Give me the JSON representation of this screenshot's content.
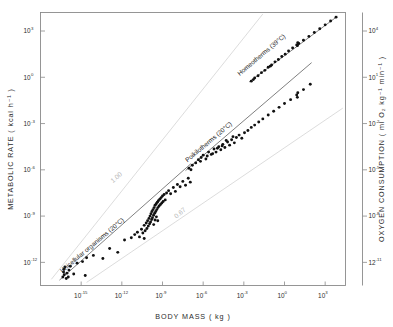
{
  "chart_data": {
    "type": "scatter",
    "title": "",
    "xlabel": "BODY  MASS ( kg )",
    "ylabel": "METABOLIC  RATE ( kcal h⁻¹ )",
    "y2label": "OXYGEN  CONSUMPTION ( ml O₂ kg⁻¹ min⁻¹ )",
    "xlim": [
      -18,
      4.5
    ],
    "ylim": [
      -13.5,
      4.2
    ],
    "y2lim": [
      -12.5,
      5.2
    ],
    "xscale": "log10",
    "yscale": "log10",
    "grid": false,
    "legend_position": "in-plot annotations",
    "xticks": [
      {
        "value": -15,
        "label": "10",
        "exp": "-15"
      },
      {
        "value": -12,
        "label": "10",
        "exp": "-12"
      },
      {
        "value": -9,
        "label": "10",
        "exp": "-9"
      },
      {
        "value": -6,
        "label": "10",
        "exp": "-6"
      },
      {
        "value": -3,
        "label": "10",
        "exp": "-3"
      },
      {
        "value": 0,
        "label": "10",
        "exp": "0"
      },
      {
        "value": 3,
        "label": "10",
        "exp": "3"
      }
    ],
    "yticks": [
      {
        "value": 3,
        "label": "10",
        "exp": "3"
      },
      {
        "value": 0,
        "label": "10",
        "exp": "0"
      },
      {
        "value": -3,
        "label": "10",
        "exp": "-3"
      },
      {
        "value": -6,
        "label": "10",
        "exp": "-6"
      },
      {
        "value": -9,
        "label": "10",
        "exp": "-9"
      },
      {
        "value": -12,
        "label": "10",
        "exp": "-12"
      }
    ],
    "y2ticks": [
      {
        "value": 4,
        "label": "10",
        "exp": "4"
      },
      {
        "value": 1,
        "label": "10",
        "exp": "1"
      },
      {
        "value": -2,
        "label": "10",
        "exp": "-2"
      },
      {
        "value": -5,
        "label": "10",
        "exp": "-5"
      },
      {
        "value": -8,
        "label": "10",
        "exp": "-8"
      },
      {
        "value": -11,
        "label": "12",
        "exp": "-11"
      }
    ],
    "reference_lines": [
      {
        "name": "slope-1.00",
        "label": "1.00",
        "slope": 1.0,
        "color": "#d8d8d8",
        "x0": -17.2,
        "y0": -13.1,
        "x1": -1.6,
        "y1": 4.1,
        "label_x": -12.3,
        "label_y": -6.6
      },
      {
        "name": "slope-0.67",
        "label": "0.67",
        "slope": 0.67,
        "color": "#d8d8d8",
        "x0": -14.6,
        "y0": -13.3,
        "x1": 4.3,
        "y1": -2.0,
        "label_x": -7.6,
        "label_y": -8.9
      }
    ],
    "series": [
      {
        "name": "Unicellular organisms (20°C)",
        "label": "Unicellular organisms (20°C)",
        "temperature": "20°C",
        "label_x": -14.1,
        "label_y": -11.0,
        "label_rotation": -40,
        "fit": {
          "x0": -16.6,
          "y0": -13.15,
          "x1": -6.9,
          "y1": -5.6
        },
        "points": [
          [
            -16.35,
            -12.95
          ],
          [
            -16.3,
            -12.62
          ],
          [
            -16.28,
            -12.45
          ],
          [
            -16.25,
            -12.8
          ],
          [
            -16.2,
            -12.3
          ],
          [
            -16.1,
            -13.05
          ],
          [
            -16.05,
            -12.7
          ],
          [
            -15.95,
            -12.95
          ],
          [
            -15.9,
            -12.5
          ],
          [
            -15.8,
            -12.25
          ],
          [
            -15.55,
            -12.75
          ],
          [
            -15.3,
            -12.05
          ],
          [
            -14.9,
            -11.95
          ],
          [
            -14.7,
            -12.85
          ],
          [
            -14.6,
            -11.7
          ],
          [
            -14.1,
            -11.55
          ],
          [
            -13.4,
            -11.75
          ],
          [
            -12.9,
            -11.1
          ],
          [
            -12.3,
            -11.35
          ],
          [
            -11.8,
            -10.55
          ],
          [
            -11.3,
            -10.4
          ],
          [
            -11.05,
            -10.2
          ],
          [
            -10.85,
            -10.05
          ],
          [
            -10.7,
            -10.35
          ],
          [
            -10.55,
            -9.85
          ],
          [
            -10.45,
            -10.1
          ],
          [
            -10.35,
            -9.6
          ],
          [
            -10.28,
            -9.95
          ],
          [
            -10.2,
            -9.45
          ],
          [
            -10.15,
            -9.8
          ],
          [
            -10.1,
            -9.3
          ],
          [
            -10.05,
            -9.65
          ],
          [
            -10.0,
            -9.15
          ],
          [
            -9.95,
            -9.5
          ],
          [
            -9.92,
            -9.0
          ],
          [
            -9.88,
            -9.38
          ],
          [
            -9.85,
            -8.85
          ],
          [
            -9.8,
            -9.22
          ],
          [
            -9.78,
            -8.7
          ],
          [
            -9.74,
            -9.1
          ],
          [
            -9.7,
            -8.58
          ],
          [
            -9.66,
            -8.95
          ],
          [
            -9.62,
            -8.45
          ],
          [
            -9.58,
            -8.82
          ],
          [
            -9.55,
            -8.3
          ],
          [
            -9.5,
            -8.7
          ],
          [
            -9.46,
            -8.2
          ],
          [
            -9.42,
            -8.58
          ],
          [
            -9.38,
            -8.1
          ],
          [
            -9.34,
            -8.45
          ],
          [
            -9.3,
            -8.0
          ],
          [
            -9.25,
            -8.35
          ],
          [
            -9.2,
            -7.9
          ],
          [
            -9.15,
            -8.25
          ],
          [
            -9.1,
            -7.8
          ],
          [
            -9.05,
            -8.15
          ],
          [
            -9.0,
            -7.7
          ],
          [
            -8.95,
            -8.05
          ],
          [
            -8.88,
            -7.6
          ],
          [
            -8.8,
            -7.95
          ],
          [
            -8.7,
            -7.5
          ],
          [
            -8.55,
            -7.35
          ],
          [
            -8.4,
            -7.55
          ],
          [
            -8.2,
            -7.15
          ],
          [
            -8.05,
            -7.4
          ],
          [
            -7.9,
            -6.95
          ],
          [
            -7.7,
            -7.1
          ],
          [
            -7.5,
            -6.75
          ],
          [
            -7.3,
            -7.0
          ],
          [
            -7.1,
            -6.55
          ],
          [
            -6.95,
            -6.8
          ],
          [
            -9.45,
            -9.05
          ],
          [
            -9.35,
            -9.3
          ],
          [
            -9.55,
            -9.25
          ],
          [
            -9.65,
            -9.55
          ],
          [
            -10.35,
            -10.45
          ]
        ]
      },
      {
        "name": "Poikilotherms (20°C)",
        "label": "Poikilotherms (20°C)",
        "temperature": "20°C",
        "label_x": -5.5,
        "label_y": -4.3,
        "label_rotation": -40,
        "fit": {
          "x0": -7.3,
          "y0": -6.05,
          "x1": 2.0,
          "y1": 0.95
        },
        "points": [
          [
            -7.05,
            -5.9
          ],
          [
            -6.8,
            -5.7
          ],
          [
            -6.55,
            -5.55
          ],
          [
            -6.35,
            -5.35
          ],
          [
            -6.15,
            -5.2
          ],
          [
            -6.0,
            -5.05
          ],
          [
            -5.8,
            -5.3
          ],
          [
            -5.6,
            -4.85
          ],
          [
            -5.4,
            -5.0
          ],
          [
            -5.2,
            -4.65
          ],
          [
            -5.05,
            -4.85
          ],
          [
            -4.85,
            -4.5
          ],
          [
            -4.7,
            -4.7
          ],
          [
            -4.55,
            -4.35
          ],
          [
            -4.4,
            -4.55
          ],
          [
            -4.2,
            -4.2
          ],
          [
            -4.05,
            -4.4
          ],
          [
            -3.9,
            -4.05
          ],
          [
            -3.7,
            -4.25
          ],
          [
            -3.55,
            -3.9
          ],
          [
            -3.35,
            -3.75
          ],
          [
            -3.15,
            -3.95
          ],
          [
            -2.95,
            -3.6
          ],
          [
            -2.7,
            -3.45
          ],
          [
            -2.45,
            -3.25
          ],
          [
            -2.2,
            -3.1
          ],
          [
            -1.9,
            -2.9
          ],
          [
            -1.6,
            -2.7
          ],
          [
            -1.2,
            -2.45
          ],
          [
            -0.8,
            -2.2
          ],
          [
            -0.4,
            -1.95
          ],
          [
            0.0,
            -1.7
          ],
          [
            0.45,
            -1.45
          ],
          [
            0.9,
            -1.15
          ],
          [
            1.4,
            -0.8
          ],
          [
            1.9,
            -0.45
          ],
          [
            -6.9,
            -6.0
          ],
          [
            -6.2,
            -5.45
          ],
          [
            -5.7,
            -5.1
          ],
          [
            -5.3,
            -4.95
          ],
          [
            -4.95,
            -4.6
          ],
          [
            -4.6,
            -4.45
          ],
          [
            -4.3,
            -4.1
          ],
          [
            -3.8,
            -3.85
          ],
          [
            0.95,
            -1.3
          ],
          [
            0.98,
            -1.0
          ]
        ]
      },
      {
        "name": "Homeotherms (39°C)",
        "label": "Homeotherms (39°C)",
        "temperature": "39°C",
        "label_x": -1.6,
        "label_y": 1.35,
        "label_rotation": -40,
        "fit": {
          "x0": -2.6,
          "y0": -0.3,
          "x1": 3.9,
          "y1": 3.95
        },
        "points": [
          [
            -2.45,
            -0.25
          ],
          [
            -2.2,
            -0.05
          ],
          [
            -1.95,
            0.1
          ],
          [
            -1.7,
            0.3
          ],
          [
            -1.45,
            0.45
          ],
          [
            -1.2,
            0.65
          ],
          [
            -0.95,
            0.8
          ],
          [
            -0.7,
            1.0
          ],
          [
            -0.45,
            1.15
          ],
          [
            -0.2,
            1.35
          ],
          [
            0.05,
            1.5
          ],
          [
            0.3,
            1.7
          ],
          [
            0.6,
            1.9
          ],
          [
            0.9,
            2.1
          ],
          [
            1.0,
            2.15
          ],
          [
            1.05,
            2.2
          ],
          [
            1.4,
            2.4
          ],
          [
            1.8,
            2.65
          ],
          [
            2.2,
            2.9
          ],
          [
            2.6,
            3.15
          ],
          [
            3.0,
            3.4
          ],
          [
            3.4,
            3.65
          ],
          [
            3.8,
            3.9
          ],
          [
            -2.3,
            -0.15
          ],
          [
            -1.05,
            0.72
          ],
          [
            0.95,
            2.05
          ],
          [
            0.98,
            2.25
          ]
        ]
      }
    ]
  }
}
